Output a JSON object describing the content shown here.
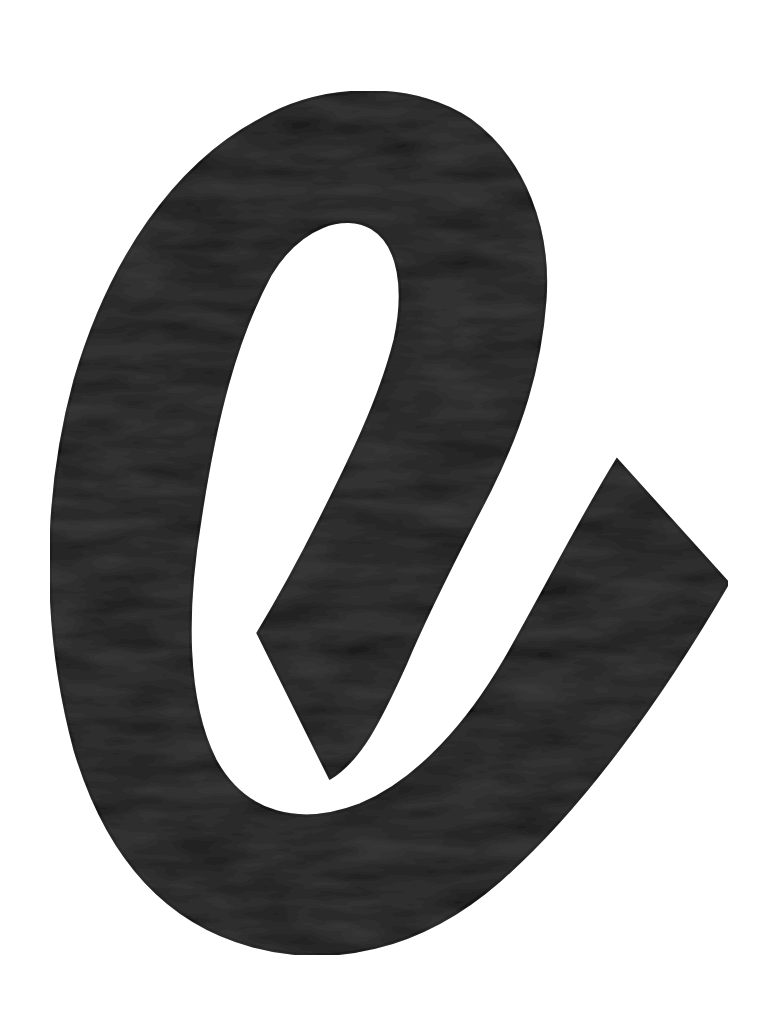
{
  "image": {
    "subject": "Hand-painted lowercase letter e",
    "label": "e",
    "colors": {
      "background": "#ffffff",
      "paint": "#1f1f1f",
      "paint_edge": "#111111",
      "brush_texture": "#2a2a2a"
    }
  }
}
